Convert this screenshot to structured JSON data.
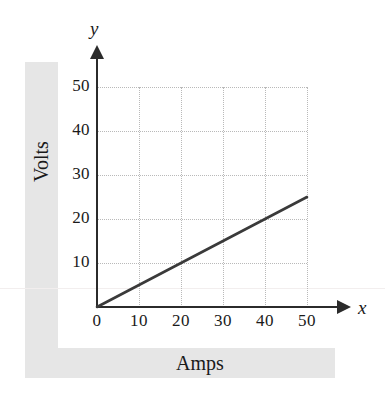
{
  "chart_data": {
    "type": "line",
    "title": "",
    "xlabel": "Amps",
    "ylabel": "Volts",
    "x_var": "x",
    "y_var": "y",
    "xlim": [
      0,
      50
    ],
    "ylim": [
      0,
      50
    ],
    "xticks": [
      0,
      10,
      20,
      30,
      40,
      50
    ],
    "yticks": [
      10,
      20,
      30,
      40,
      50
    ],
    "xtick_labels": [
      "0",
      "10",
      "20",
      "30",
      "40",
      "50"
    ],
    "ytick_labels": [
      "10",
      "20",
      "30",
      "40",
      "50"
    ],
    "grid": true,
    "grid_style": "dotted",
    "legend": "none",
    "series": [
      {
        "name": "Volts vs Amps",
        "slope": 0.5,
        "intercept": 0,
        "color": "#3a3a3a",
        "x": [
          0,
          10,
          20,
          30,
          40,
          50
        ],
        "values": [
          0,
          5,
          10,
          15,
          20,
          25
        ]
      }
    ],
    "annotations": []
  },
  "axes": {
    "y_label": "Volts",
    "x_label": "Amps",
    "y_variable": "y",
    "x_variable": "x"
  },
  "colors": {
    "line": "#3a3a3a",
    "axis": "#2b2b2b",
    "grid": "#b9b9b9",
    "band": "#e6e6e6",
    "text": "#1a1a1a",
    "background": "#ffffff"
  }
}
